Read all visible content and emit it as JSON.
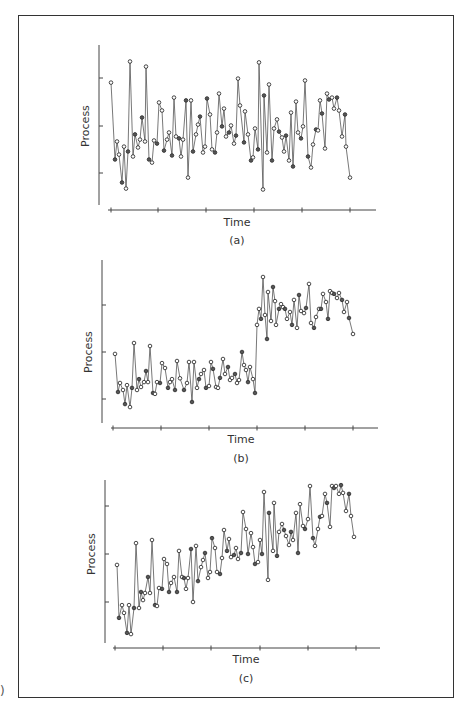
{
  "figure": {
    "edge_glyph": ")",
    "panels": [
      {
        "id": "a",
        "caption": "(a)",
        "xlabel": "Time",
        "ylabel": "Process"
      },
      {
        "id": "b",
        "caption": "(b)",
        "xlabel": "Time",
        "ylabel": "Process"
      },
      {
        "id": "c",
        "caption": "(c)",
        "xlabel": "Time",
        "ylabel": "Process"
      }
    ]
  },
  "chart_data": [
    {
      "type": "line",
      "title": "(a)",
      "description": "Stationary process fluctuating around a constant mean",
      "xlabel": "Time",
      "ylabel": "Process",
      "grid": false,
      "legend": null,
      "ylim": [
        0,
        10
      ],
      "yticks": [
        2.5,
        5,
        7.5
      ],
      "xticks_count": 6,
      "markers": "open circles",
      "layout": {
        "x0": 99,
        "y_axis_top": 45,
        "y_axis_bottom": 205,
        "x_axis_y": 210,
        "x_axis_left": 108,
        "x_axis_right": 376,
        "xticks_px": [
          111,
          158,
          206,
          254,
          302,
          350
        ],
        "yticks_px": [
          173,
          126,
          78
        ],
        "ylabel_x": 89,
        "ylabel_y": 126,
        "xlabel_x": 237,
        "xlabel_y": 226,
        "caption_y": 244,
        "x_px_start": 111,
        "x_px_end": 350
      },
      "x": [
        111,
        115,
        117,
        119,
        122,
        124,
        126,
        128,
        130,
        133,
        135,
        138,
        140,
        142,
        145,
        146,
        149,
        152,
        154,
        157,
        159,
        162,
        164,
        167,
        169,
        172,
        174,
        176,
        179,
        181,
        183,
        186,
        188,
        191,
        193,
        196,
        198,
        200,
        203,
        205,
        207,
        210,
        212,
        215,
        217,
        219,
        222,
        224,
        226,
        229,
        231,
        234,
        236,
        238,
        240,
        244,
        245,
        248,
        251,
        253,
        255,
        258,
        259,
        263,
        264,
        267,
        269,
        272,
        274,
        277,
        279,
        282,
        284,
        286,
        289,
        291,
        293,
        296,
        298,
        301,
        303,
        305,
        308,
        311,
        313,
        316,
        318,
        320,
        322,
        325,
        327,
        329,
        332,
        334,
        337,
        339,
        342,
        345,
        346,
        350
      ],
      "values": [
        7.26,
        3.21,
        4.16,
        3.47,
        2.0,
        3.89,
        1.68,
        3.63,
        8.37,
        3.37,
        4.53,
        3.84,
        4.26,
        5.42,
        4.16,
        8.1,
        3.21,
        3.05,
        4.21,
        4.05,
        6.21,
        5.79,
        3.68,
        4.26,
        4.63,
        3.42,
        6.47,
        4.42,
        4.32,
        3.37,
        4.26,
        6.32,
        2.26,
        6.32,
        3.63,
        4.53,
        5.05,
        5.47,
        3.58,
        3.89,
        6.42,
        5.58,
        3.74,
        3.58,
        4.63,
        6.68,
        4.95,
        5.89,
        4.42,
        4.63,
        5.0,
        4.05,
        4.47,
        7.47,
        6.05,
        4.11,
        5.74,
        4.53,
        3.16,
        3.32,
        4.84,
        3.74,
        8.32,
        1.63,
        6.58,
        3.58,
        7.16,
        3.16,
        4.84,
        5.32,
        4.68,
        4.37,
        3.63,
        4.47,
        3.16,
        5.68,
        2.84,
        6.26,
        4.63,
        4.32,
        4.95,
        7.37,
        3.37,
        2.79,
        4.0,
        4.79,
        4.74,
        6.32,
        5.63,
        3.79,
        6.68,
        6.37,
        6.47,
        5.89,
        6.47,
        5.79,
        4.42,
        5.58,
        3.89,
        2.26
      ]
    },
    {
      "type": "line",
      "title": "(b)",
      "description": "Process with an abrupt level shift (step change) midway",
      "xlabel": "Time",
      "ylabel": "Process",
      "grid": false,
      "legend": null,
      "ylim": [
        0,
        10
      ],
      "yticks": [
        2.5,
        5,
        7.5
      ],
      "xticks_count": 6,
      "markers": "open circles",
      "layout": {
        "x0": 102,
        "y_axis_top": 260,
        "y_axis_bottom": 423,
        "x_axis_y": 428,
        "x_axis_left": 111,
        "x_axis_right": 378,
        "xticks_px": [
          113,
          161,
          209,
          257,
          305,
          353
        ],
        "yticks_px": [
          399,
          352,
          305
        ],
        "ylabel_x": 92,
        "ylabel_y": 352,
        "xlabel_x": 241,
        "xlabel_y": 443,
        "caption_y": 462,
        "x_px_start": 115,
        "x_px_end": 353
      },
      "x": [
        115,
        118,
        120,
        123,
        125,
        127,
        130,
        132,
        134,
        137,
        139,
        141,
        144,
        146,
        148,
        150,
        153,
        155,
        157,
        160,
        162,
        165,
        168,
        170,
        172,
        175,
        177,
        180,
        184,
        187,
        189,
        192,
        194,
        197,
        199,
        201,
        204,
        206,
        209,
        211,
        213,
        216,
        218,
        220,
        223,
        225,
        228,
        230,
        232,
        235,
        237,
        239,
        242,
        244,
        246,
        248,
        250,
        253,
        255,
        257,
        259,
        261,
        263,
        265,
        267,
        268,
        271,
        273,
        275,
        276,
        279,
        281,
        283,
        285,
        287,
        290,
        292,
        294,
        297,
        299,
        301,
        304,
        306,
        309,
        311,
        314,
        316,
        319,
        321,
        323,
        326,
        328,
        330,
        332,
        334,
        337,
        339,
        342,
        344,
        347,
        349,
        353
      ],
      "values": [
        4.9,
        2.87,
        3.35,
        2.98,
        2.23,
        3.24,
        2.07,
        3.09,
        5.48,
        2.98,
        3.56,
        3.14,
        3.4,
        3.99,
        3.4,
        5.32,
        2.82,
        2.77,
        3.4,
        3.35,
        4.41,
        4.15,
        3.09,
        3.4,
        3.56,
        2.98,
        4.52,
        3.6,
        2.98,
        3.35,
        4.47,
        2.34,
        4.47,
        3.09,
        3.56,
        3.83,
        4.04,
        3.09,
        3.19,
        4.47,
        4.1,
        3.14,
        3.09,
        3.62,
        4.63,
        3.83,
        4.2,
        3.51,
        3.62,
        3.83,
        3.35,
        3.51,
        5.0,
        4.31,
        4.04,
        3.4,
        4.2,
        3.56,
        2.82,
        6.44,
        7.29,
        6.76,
        8.99,
        6.97,
        5.69,
        8.19,
        6.65,
        8.46,
        7.71,
        6.44,
        7.29,
        7.55,
        7.39,
        7.29,
        6.76,
        7.13,
        6.44,
        7.77,
        6.28,
        8.03,
        7.18,
        7.07,
        7.34,
        8.62,
        6.54,
        6.28,
        6.86,
        7.29,
        7.29,
        8.09,
        7.66,
        6.76,
        8.24,
        8.14,
        8.09,
        7.87,
        8.14,
        7.77,
        7.13,
        7.66,
        6.81,
        5.96
      ]
    },
    {
      "type": "line",
      "title": "(c)",
      "description": "Process with a gradual upward trend (drift) over time",
      "xlabel": "Time",
      "ylabel": "Process",
      "grid": false,
      "legend": null,
      "ylim": [
        0,
        10
      ],
      "yticks": [
        2.5,
        5,
        7.5
      ],
      "xticks_count": 6,
      "markers": "open circles",
      "layout": {
        "x0": 105,
        "y_axis_top": 480,
        "y_axis_bottom": 643,
        "x_axis_y": 648,
        "x_axis_left": 113,
        "x_axis_right": 380,
        "xticks_px": [
          115,
          163,
          211,
          260,
          308,
          356
        ],
        "yticks_px": [
          602,
          554,
          506
        ],
        "ylabel_x": 95,
        "ylabel_y": 554,
        "xlabel_x": 246,
        "xlabel_y": 663,
        "caption_y": 682,
        "x_px_start": 117,
        "x_px_end": 354
      },
      "x": [
        117,
        119,
        122,
        124,
        127,
        129,
        131,
        134,
        136,
        139,
        141,
        143,
        145,
        148,
        150,
        152,
        155,
        157,
        159,
        162,
        164,
        167,
        169,
        171,
        174,
        177,
        179,
        182,
        184,
        186,
        188,
        191,
        193,
        196,
        198,
        201,
        203,
        205,
        208,
        210,
        212,
        215,
        217,
        220,
        222,
        224,
        227,
        229,
        231,
        234,
        236,
        238,
        241,
        243,
        246,
        248,
        251,
        253,
        255,
        258,
        260,
        262,
        264,
        268,
        269,
        273,
        274,
        277,
        279,
        282,
        284,
        286,
        289,
        291,
        293,
        296,
        298,
        300,
        303,
        305,
        308,
        310,
        313,
        315,
        318,
        320,
        322,
        325,
        327,
        330,
        332,
        334,
        336,
        339,
        341,
        343,
        346,
        349,
        351,
        354
      ],
      "values": [
        4.43,
        1.67,
        2.34,
        1.93,
        0.89,
        2.34,
        0.83,
        2.19,
        5.57,
        2.19,
        3.02,
        2.6,
        2.97,
        3.8,
        2.97,
        5.73,
        2.34,
        2.29,
        3.23,
        3.18,
        4.74,
        4.48,
        3.02,
        3.49,
        3.8,
        3.02,
        5.16,
        3.8,
        3.75,
        3.18,
        3.75,
        5.26,
        2.5,
        5.42,
        3.59,
        4.32,
        4.69,
        5.05,
        3.75,
        4.06,
        5.83,
        5.31,
        4.06,
        3.96,
        4.79,
        6.25,
        5.16,
        5.78,
        4.84,
        4.95,
        5.31,
        4.74,
        5.05,
        7.19,
        6.3,
        5.0,
        6.09,
        5.36,
        4.48,
        4.58,
        5.73,
        5.0,
        8.23,
        3.65,
        7.14,
        5.16,
        7.66,
        4.9,
        6.15,
        6.56,
        6.25,
        5.94,
        5.47,
        6.15,
        5.73,
        7.14,
        5.05,
        7.6,
        6.46,
        6.3,
        6.82,
        8.54,
        5.83,
        5.42,
        6.3,
        6.93,
        6.98,
        8.13,
        7.66,
        6.41,
        8.54,
        8.44,
        8.54,
        8.13,
        8.59,
        8.18,
        7.24,
        8.13,
        6.98,
        5.89
      ]
    }
  ]
}
